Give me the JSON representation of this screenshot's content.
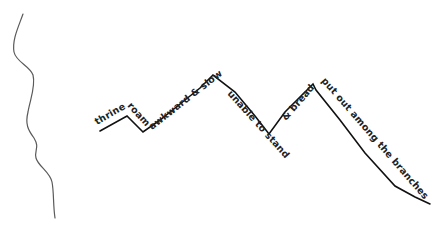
{
  "drawing": {
    "title": "",
    "stroke_color": "#111111",
    "wavy_line_color": "#555555",
    "background": "#ffffff",
    "labels": [
      {
        "text": "thrine",
        "segment": "rising-1"
      },
      {
        "text": "roam",
        "segment": "falling-1"
      },
      {
        "text": "awkward & slow",
        "segment": "rising-2"
      },
      {
        "text": "unable to stand",
        "segment": "falling-2"
      },
      {
        "text": "& bread",
        "segment": "rising-3"
      },
      {
        "text": "put out among the branches",
        "segment": "falling-3"
      }
    ]
  }
}
